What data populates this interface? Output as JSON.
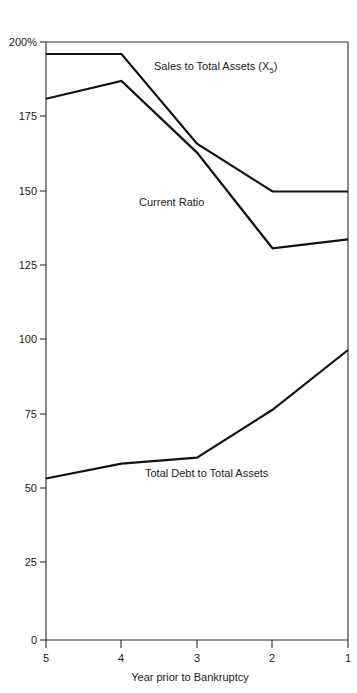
{
  "chart_data": {
    "type": "line",
    "title": "",
    "subtitle": "",
    "xlabel": "Year prior to Bankruptcy",
    "ylabel": "",
    "x": [
      5,
      4,
      3,
      2,
      1
    ],
    "categories": [
      "5",
      "4",
      "3",
      "2",
      "1"
    ],
    "xlim": [
      5,
      1
    ],
    "ylim": [
      0,
      200
    ],
    "x_tick_labels": [
      "5",
      "4",
      "3",
      "2",
      "1"
    ],
    "y_tick_labels": [
      "0",
      "25",
      "50",
      "75",
      "100",
      "125",
      "150",
      "175",
      "200%"
    ],
    "y_ticks": [
      0,
      25,
      50,
      75,
      100,
      125,
      150,
      175,
      200
    ],
    "y_unit": "%",
    "grid": false,
    "legend": "inline-annotations",
    "series": [
      {
        "name": "Sales to Total Assets (X5)",
        "label": "Sales to Total Assets (X",
        "label_sub": "5",
        "label_tail": ")",
        "values": [
          196,
          196,
          166,
          150,
          150
        ],
        "color": "#111111"
      },
      {
        "name": "Current Ratio",
        "label": "Current Ratio",
        "label_sub": "",
        "label_tail": "",
        "values": [
          181,
          187,
          163,
          131,
          134
        ],
        "color": "#111111"
      },
      {
        "name": "Total Debt to Total Assets",
        "label": "Total Debt to Total Assets",
        "label_sub": "",
        "label_tail": "",
        "values": [
          54,
          59,
          61,
          77,
          97
        ],
        "color": "#111111"
      }
    ],
    "annotations": [
      {
        "text": "Sales to Total Assets (X5)",
        "x": 3.55,
        "y": 183
      },
      {
        "text": "Current Ratio",
        "x": 3.3,
        "y": 143
      },
      {
        "text": "Total Debt to Total Assets",
        "x": 3.35,
        "y": 58
      }
    ]
  },
  "axis": {
    "x_title": "Year prior to Bankruptcy",
    "y_top_label": "200%"
  }
}
